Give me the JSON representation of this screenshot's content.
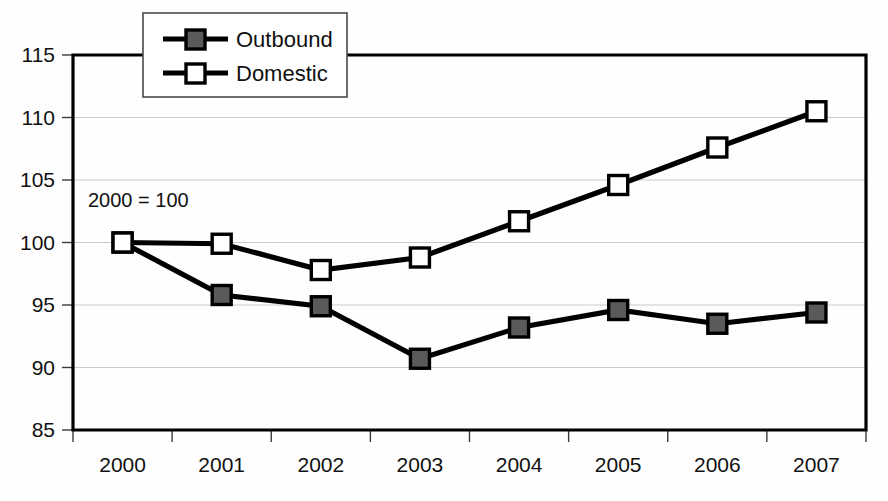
{
  "chart_data": {
    "type": "line",
    "title": "",
    "subtitle": "",
    "xlabel": "",
    "ylabel": "",
    "annotation": "2000 = 100",
    "categories": [
      "2000",
      "2001",
      "2002",
      "2003",
      "2004",
      "2005",
      "2006",
      "2007"
    ],
    "ylim": [
      85,
      115
    ],
    "y_ticks": [
      "85",
      "90",
      "95",
      "100",
      "105",
      "110",
      "115"
    ],
    "y_tick_values": [
      85,
      90,
      95,
      100,
      105,
      110,
      115
    ],
    "grid": "horizontal",
    "legend_position": "top-left-inside",
    "series": [
      {
        "name": "Outbound",
        "marker": "filled-square",
        "color": "#5a5a5a",
        "values": [
          100.0,
          95.8,
          94.9,
          90.7,
          93.2,
          94.6,
          93.5,
          94.4
        ]
      },
      {
        "name": "Domestic",
        "marker": "open-square",
        "color": "#ffffff",
        "values": [
          100.0,
          99.9,
          97.8,
          98.8,
          101.7,
          104.6,
          107.6,
          110.5
        ]
      }
    ]
  },
  "legend": {
    "entries": [
      {
        "label": "Outbound"
      },
      {
        "label": "Domestic"
      }
    ]
  },
  "colors": {
    "line": "#000000",
    "gridline": "#c9c9c9",
    "background": "#fefefe",
    "outbound_marker_fill": "#5a5a5a",
    "domestic_marker_fill": "#ffffff"
  }
}
